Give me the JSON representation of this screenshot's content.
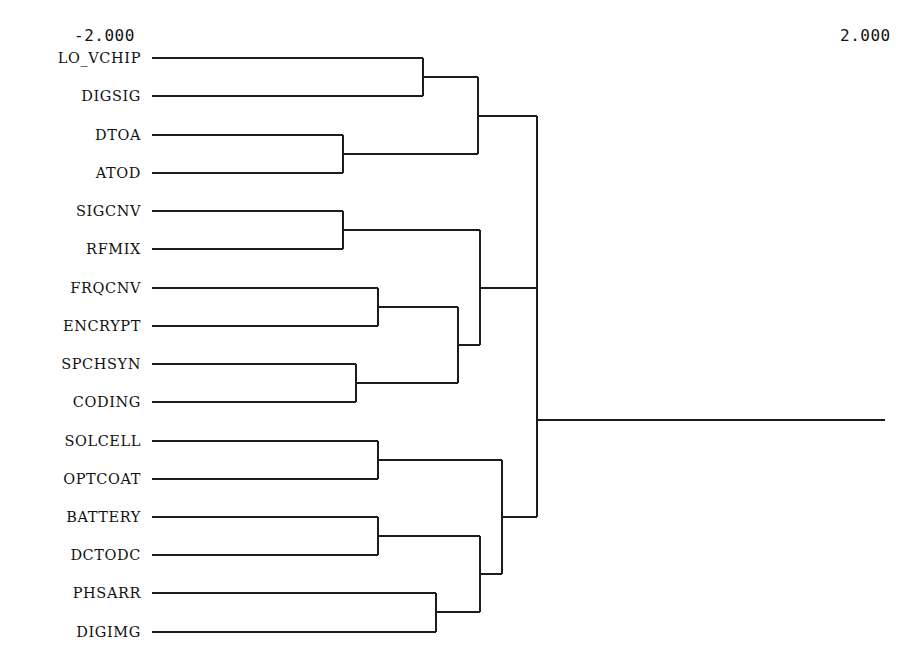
{
  "chart_data": {
    "type": "dendrogram",
    "title": "",
    "xlabel": "",
    "ylabel": "",
    "axis": {
      "left_label": "-2.000",
      "right_label": "2.000",
      "range": [
        -2.0,
        2.0
      ],
      "orientation": "horizontal",
      "direction": "left-to-right",
      "grid": false,
      "ticks_visible": false
    },
    "leaf_count": 16,
    "leaves": [
      "LO_VCHIP",
      "DIGSIG",
      "DTOA",
      "ATOD",
      "SIGCNV",
      "RFMIX",
      "FRQCNV",
      "ENCRYPT",
      "SPCHSYN",
      "CODING",
      "SOLCELL",
      "OPTCOAT",
      "BATTERY",
      "DCTODC",
      "PHSARR",
      "DIGIMG"
    ],
    "leaf_rows": [
      {
        "label": "LO_VCHIP",
        "index": 0,
        "y": 58
      },
      {
        "label": "DIGSIG",
        "index": 1,
        "y": 96
      },
      {
        "label": "DTOA",
        "index": 2,
        "y": 135
      },
      {
        "label": "ATOD",
        "index": 3,
        "y": 173
      },
      {
        "label": "SIGCNV",
        "index": 4,
        "y": 211
      },
      {
        "label": "RFMIX",
        "index": 5,
        "y": 249
      },
      {
        "label": "FRQCNV",
        "index": 6,
        "y": 288
      },
      {
        "label": "ENCRYPT",
        "index": 7,
        "y": 326
      },
      {
        "label": "SPCHSYN",
        "index": 8,
        "y": 364
      },
      {
        "label": "CODING",
        "index": 9,
        "y": 402
      },
      {
        "label": "SOLCELL",
        "index": 10,
        "y": 441
      },
      {
        "label": "OPTCOAT",
        "index": 11,
        "y": 479
      },
      {
        "label": "BATTERY",
        "index": 12,
        "y": 517
      },
      {
        "label": "DCTODC",
        "index": 13,
        "y": 555
      },
      {
        "label": "PHSARR",
        "index": 14,
        "y": 593
      },
      {
        "label": "DIGIMG",
        "index": 15,
        "y": 632
      }
    ],
    "leaf_start_x": 152,
    "root_stem_end_x": 885,
    "merges": [
      {
        "id": "m1",
        "members": [
          "LO_VCHIP",
          "DIGSIG"
        ],
        "x": 423,
        "y_top": 58,
        "y_bottom": 96,
        "y_mid": 77
      },
      {
        "id": "m2",
        "members": [
          "DTOA",
          "ATOD"
        ],
        "x": 343,
        "y_top": 135,
        "y_bottom": 173,
        "y_mid": 154
      },
      {
        "id": "m3",
        "members": [
          "m1",
          "m2"
        ],
        "x": 478,
        "y_top": 77,
        "y_bottom": 154,
        "y_mid": 116
      },
      {
        "id": "m4",
        "members": [
          "SIGCNV",
          "RFMIX"
        ],
        "x": 343,
        "y_top": 211,
        "y_bottom": 249,
        "y_mid": 230
      },
      {
        "id": "m5",
        "members": [
          "FRQCNV",
          "ENCRYPT"
        ],
        "x": 378,
        "y_top": 288,
        "y_bottom": 326,
        "y_mid": 307
      },
      {
        "id": "m6",
        "members": [
          "SPCHSYN",
          "CODING"
        ],
        "x": 356,
        "y_top": 364,
        "y_bottom": 402,
        "y_mid": 383
      },
      {
        "id": "m7",
        "members": [
          "m5",
          "m6"
        ],
        "x": 458,
        "y_top": 307,
        "y_bottom": 383,
        "y_mid": 345
      },
      {
        "id": "m8",
        "members": [
          "m4",
          "m7"
        ],
        "x": 480,
        "y_top": 230,
        "y_bottom": 345,
        "y_mid": 288
      },
      {
        "id": "m9",
        "members": [
          "m3",
          "m8"
        ],
        "x": 537,
        "y_top": 116,
        "y_bottom": 288,
        "y_mid": 202
      },
      {
        "id": "m10",
        "members": [
          "SOLCELL",
          "OPTCOAT"
        ],
        "x": 378,
        "y_top": 441,
        "y_bottom": 479,
        "y_mid": 460
      },
      {
        "id": "m11",
        "members": [
          "BATTERY",
          "DCTODC"
        ],
        "x": 378,
        "y_top": 517,
        "y_bottom": 555,
        "y_mid": 536
      },
      {
        "id": "m12",
        "members": [
          "PHSARR",
          "DIGIMG"
        ],
        "x": 436,
        "y_top": 593,
        "y_bottom": 632,
        "y_mid": 612
      },
      {
        "id": "m13",
        "members": [
          "m11",
          "m12"
        ],
        "x": 480,
        "y_top": 536,
        "y_bottom": 612,
        "y_mid": 574
      },
      {
        "id": "m14",
        "members": [
          "m10",
          "m13"
        ],
        "x": 502,
        "y_top": 460,
        "y_bottom": 574,
        "y_mid": 517
      },
      {
        "id": "m15",
        "members": [
          "m9",
          "m14"
        ],
        "x": 537,
        "y_top": 202,
        "y_bottom": 517,
        "y_mid": 420
      }
    ],
    "clusters_at_root": 2,
    "colors": {
      "line": "#1c1c1c",
      "background": "#ffffff",
      "text": "#111111"
    }
  }
}
